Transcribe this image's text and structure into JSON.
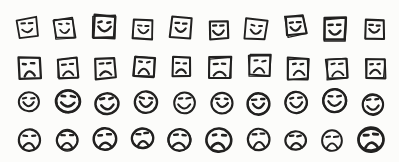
{
  "figure": {
    "ink_color": "#222120",
    "paper_color": "#fcfcfa",
    "grid": {
      "columns": 10,
      "rows": [
        {
          "id": "square-happy",
          "shape": "square",
          "mood": "happy",
          "count": 10,
          "icon": "square-happy-face-icon"
        },
        {
          "id": "square-sad",
          "shape": "square",
          "mood": "sad",
          "count": 10,
          "icon": "square-sad-face-icon"
        },
        {
          "id": "circle-happy",
          "shape": "circle",
          "mood": "happy",
          "count": 10,
          "icon": "circle-happy-face-icon"
        },
        {
          "id": "circle-sad",
          "shape": "circle",
          "mood": "sad",
          "count": 10,
          "icon": "circle-sad-face-icon"
        }
      ]
    }
  }
}
